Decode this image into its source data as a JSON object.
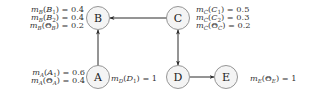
{
  "diagram": {
    "type": "directed-graph",
    "colors": {
      "node_fill": "#f4f4f4",
      "node_stroke": "#8a8a8a",
      "edge": "#2a2a2a",
      "text": "#333333"
    },
    "nodes": [
      {
        "id": "A",
        "label": "A",
        "cx": 98,
        "cy": 77
      },
      {
        "id": "B",
        "label": "B",
        "cx": 98,
        "cy": 18
      },
      {
        "id": "C",
        "label": "C",
        "cx": 178,
        "cy": 18
      },
      {
        "id": "D",
        "label": "D",
        "cx": 178,
        "cy": 77
      },
      {
        "id": "E",
        "label": "E",
        "cx": 226,
        "cy": 77
      }
    ],
    "edges": [
      {
        "from": "A",
        "to": "B",
        "direction": "forward"
      },
      {
        "from": "C",
        "to": "B",
        "direction": "forward"
      },
      {
        "from": "C",
        "to": "D",
        "direction": "both"
      },
      {
        "from": "D",
        "to": "E",
        "direction": "forward"
      }
    ],
    "mass_labels": {
      "B": [
        {
          "fn": "m",
          "sub": "B",
          "arg": "B",
          "argsub": "1",
          "value": "0.4",
          "text": "m_B(B_1) = 0.4"
        },
        {
          "fn": "m",
          "sub": "B",
          "arg": "B",
          "argsub": "2",
          "value": "0.4",
          "text": "m_B(B_2) = 0.4"
        },
        {
          "fn": "m",
          "sub": "B",
          "arg": "Θ",
          "argsub": "B",
          "value": "0.2",
          "text": "m_B(Θ_B) = 0.2"
        }
      ],
      "C": [
        {
          "fn": "m",
          "sub": "C",
          "arg": "C",
          "argsub": "1",
          "value": "0.5",
          "text": "m_C(C_1) = 0.5"
        },
        {
          "fn": "m",
          "sub": "C",
          "arg": "C",
          "argsub": "2",
          "value": "0.3",
          "text": "m_C(C_2) = 0.3"
        },
        {
          "fn": "m",
          "sub": "C",
          "arg": "Θ",
          "argsub": "C",
          "value": "0.2",
          "text": "m_C(Θ_C) = 0.2"
        }
      ],
      "A": [
        {
          "fn": "m",
          "sub": "A",
          "arg": "A",
          "argsub": "1",
          "value": "0.6",
          "text": "m_A(A_1) = 0.6"
        },
        {
          "fn": "m",
          "sub": "A",
          "arg": "Θ",
          "argsub": "A",
          "value": "0.4",
          "text": "m_A(Θ_A) = 0.4"
        }
      ],
      "D": [
        {
          "fn": "m",
          "sub": "D",
          "arg": "D",
          "argsub": "1",
          "value": "1",
          "text": "m_D(D_1) = 1"
        }
      ],
      "E": [
        {
          "fn": "m",
          "sub": "E",
          "arg": "Θ",
          "argsub": "E",
          "value": "1",
          "text": "m_E(Θ_E) = 1"
        }
      ]
    }
  }
}
